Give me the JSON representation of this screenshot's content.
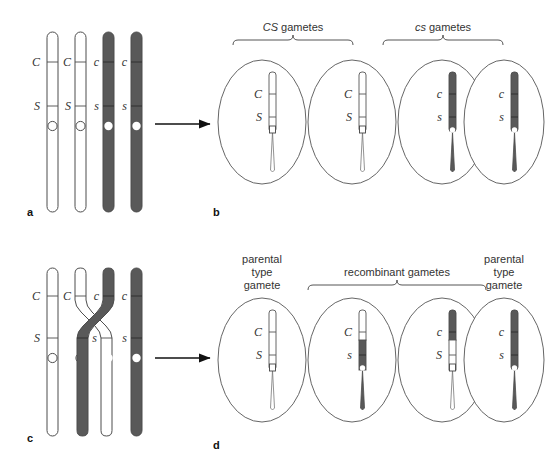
{
  "figure": {
    "colors": {
      "dark_chromatid": "#595959",
      "light_chromatid": "#ffffff",
      "outline": "#4d4d4d",
      "text": "#333333",
      "arrow": "#111111",
      "background": "#ffffff"
    }
  },
  "panels": [
    {
      "id": "a",
      "letter": "a",
      "caption": "",
      "description": "Tetrad of four chromatids with no crossing over",
      "chromatids": [
        {
          "name": "chromatid-1",
          "shade": "light",
          "top_allele": "C",
          "bottom_allele": "S",
          "centromere": "open-circle"
        },
        {
          "name": "chromatid-2",
          "shade": "light",
          "top_allele": "C",
          "bottom_allele": "S",
          "centromere": "open-circle"
        },
        {
          "name": "chromatid-3",
          "shade": "dark",
          "top_allele": "c",
          "bottom_allele": "s",
          "centromere": "filled-white-dot"
        },
        {
          "name": "chromatid-4",
          "shade": "dark",
          "top_allele": "c",
          "bottom_allele": "s",
          "centromere": "filled-white-dot"
        }
      ]
    },
    {
      "id": "b",
      "letter": "b",
      "brackets": [
        {
          "name": "bracket-CS",
          "italic_part": "CS",
          "plain_part": " gametes",
          "full": "CS gametes"
        },
        {
          "name": "bracket-cs",
          "italic_part": "cs",
          "plain_part": " gametes",
          "full": "cs gametes"
        }
      ],
      "gametes": [
        {
          "name": "gamete-1",
          "top_allele": "C",
          "bottom_allele": "S",
          "top_shade": "light",
          "bottom_shade": "light",
          "centromere": "open-square"
        },
        {
          "name": "gamete-2",
          "top_allele": "C",
          "bottom_allele": "S",
          "top_shade": "light",
          "bottom_shade": "light",
          "centromere": "open-square"
        },
        {
          "name": "gamete-3",
          "top_allele": "c",
          "bottom_allele": "s",
          "top_shade": "dark",
          "bottom_shade": "dark",
          "centromere": "white-dot"
        },
        {
          "name": "gamete-4",
          "top_allele": "c",
          "bottom_allele": "s",
          "top_shade": "dark",
          "bottom_shade": "dark",
          "centromere": "white-dot"
        }
      ]
    },
    {
      "id": "c",
      "letter": "c",
      "description": "Tetrad with a crossover between the two inner chromatids",
      "chromatids": [
        {
          "name": "chromatid-1",
          "shade": "light",
          "top_allele": "C",
          "bottom_allele": "S",
          "centromere": "open-circle",
          "crossover": false
        },
        {
          "name": "chromatid-2",
          "shade": "light",
          "top_allele": "C",
          "bottom_allele": "s",
          "centromere": "open-circle",
          "crossover": true
        },
        {
          "name": "chromatid-3",
          "shade": "dark",
          "top_allele": "c",
          "bottom_allele": "s",
          "centromere": "filled-white-dot",
          "crossover": true
        },
        {
          "name": "chromatid-4",
          "shade": "dark",
          "top_allele": "c",
          "bottom_allele": "s",
          "centromere": "filled-white-dot",
          "crossover": false
        }
      ]
    },
    {
      "id": "d",
      "letter": "d",
      "labels": [
        {
          "name": "label-parental-left",
          "lines": [
            "parental",
            "type",
            "gamete"
          ]
        },
        {
          "name": "label-recombinant",
          "lines": [
            "recombinant gametes"
          ]
        },
        {
          "name": "label-parental-right",
          "lines": [
            "parental",
            "type",
            "gamete"
          ]
        }
      ],
      "gametes": [
        {
          "name": "gamete-1",
          "top_allele": "C",
          "bottom_allele": "S",
          "top_shade": "light",
          "bottom_shade": "light",
          "centromere": "open-square",
          "type": "parental"
        },
        {
          "name": "gamete-2",
          "top_allele": "C",
          "bottom_allele": "s",
          "top_shade": "light",
          "bottom_shade": "dark",
          "centromere": "white-dot",
          "type": "recombinant"
        },
        {
          "name": "gamete-3",
          "top_allele": "c",
          "bottom_allele": "S",
          "top_shade": "dark",
          "bottom_shade": "light",
          "centromere": "open-square",
          "type": "recombinant"
        },
        {
          "name": "gamete-4",
          "top_allele": "c",
          "bottom_allele": "s",
          "top_shade": "dark",
          "bottom_shade": "dark",
          "centromere": "white-dot",
          "type": "parental"
        }
      ]
    }
  ],
  "arrows": [
    {
      "name": "arrow-a-to-b",
      "direction": "right"
    },
    {
      "name": "arrow-c-to-d",
      "direction": "right"
    }
  ]
}
